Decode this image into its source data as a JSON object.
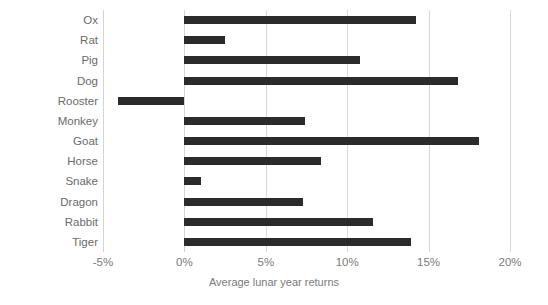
{
  "chart_data": {
    "type": "bar",
    "orientation": "horizontal",
    "title": "",
    "xlabel": "Average lunar year returns",
    "ylabel": "",
    "categories": [
      "Ox",
      "Rat",
      "Pig",
      "Dog",
      "Rooster",
      "Monkey",
      "Goat",
      "Horse",
      "Snake",
      "Dragon",
      "Rabbit",
      "Tiger"
    ],
    "values": [
      14.2,
      2.5,
      10.8,
      16.8,
      -4.1,
      7.4,
      18.1,
      8.4,
      1.0,
      7.3,
      11.6,
      13.9
    ],
    "value_unit": "%",
    "xlim": [
      -5,
      20
    ],
    "xticks": [
      -5,
      0,
      5,
      10,
      15,
      20
    ],
    "xtick_labels": [
      "-5%",
      "0%",
      "5%",
      "10%",
      "15%",
      "20%"
    ],
    "grid": "vertical",
    "legend": "none",
    "bar_color": "#2b2b2b",
    "gridline_color": "#d9d9d9",
    "label_color": "#6b6b6b"
  },
  "axis": {
    "x_title": "Average lunar year returns"
  }
}
